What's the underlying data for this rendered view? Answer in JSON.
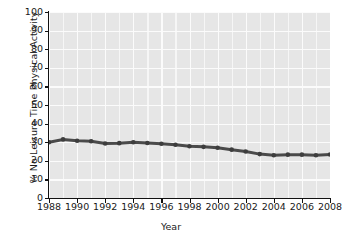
{
  "chart_data": {
    "type": "line",
    "title": "",
    "xlabel": "Year",
    "ylabel": "% No Leisure Time Physical Activity",
    "xlim": [
      1988,
      2008
    ],
    "ylim": [
      0,
      100
    ],
    "grid": true,
    "legend": "none",
    "line_color": "#4a4a4a",
    "marker": "circle",
    "x": [
      1988,
      1989,
      1990,
      1991,
      1992,
      1993,
      1994,
      1995,
      1996,
      1997,
      1998,
      1999,
      2000,
      2001,
      2002,
      2003,
      2004,
      2005,
      2006,
      2007,
      2008
    ],
    "values": [
      30.0,
      31.5,
      30.8,
      30.5,
      29.3,
      29.5,
      30.0,
      29.6,
      29.2,
      28.6,
      27.8,
      27.5,
      27.0,
      26.0,
      25.0,
      23.6,
      23.0,
      23.3,
      23.3,
      23.0,
      23.4
    ],
    "ytick_labels": [
      "100",
      "90",
      "80",
      "70",
      "60",
      "50",
      "40",
      "30",
      "20",
      "10",
      "0"
    ],
    "ytick_values": [
      100,
      90,
      80,
      70,
      60,
      50,
      40,
      30,
      20,
      10,
      0
    ],
    "xtick_labels": [
      "1988",
      "1990",
      "1992",
      "1994",
      "1996",
      "1998",
      "2000",
      "2002",
      "2004",
      "2006",
      "2008"
    ],
    "xtick_values": [
      1988,
      1990,
      1992,
      1994,
      1996,
      1998,
      2000,
      2002,
      2004,
      2006,
      2008
    ],
    "plot_background": "#e6e6e6",
    "gridline_color": "#fbfbfb",
    "axis_color": "#111111"
  }
}
